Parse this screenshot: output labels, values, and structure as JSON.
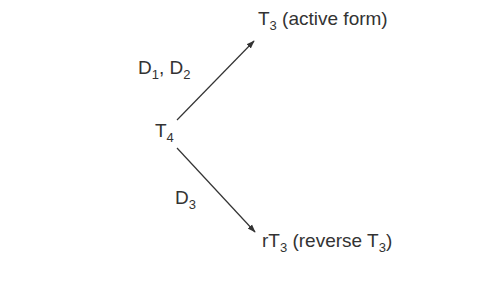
{
  "diagram": {
    "type": "reaction-branch",
    "source": {
      "base": "T",
      "sub": "4"
    },
    "upper_enzymes": [
      {
        "base": "D",
        "sub": "1",
        "suffix": ", "
      },
      {
        "base": "D",
        "sub": "2",
        "suffix": ""
      }
    ],
    "lower_enzyme": {
      "base": "D",
      "sub": "3"
    },
    "upper_product": {
      "base": "T",
      "sub": "3",
      "suffix": " (active form)"
    },
    "lower_product": {
      "prefix": "rT",
      "sub": "3",
      "middle": " (reverse T",
      "sub2": "3",
      "suffix": ")"
    },
    "colors": {
      "text": "#333333",
      "arrow": "#333333",
      "background": "#ffffff"
    }
  }
}
